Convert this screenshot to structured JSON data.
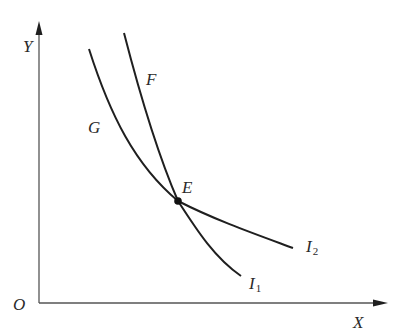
{
  "diagram": {
    "type": "indifference-curves",
    "colors": {
      "background": "#ffffff",
      "line": "#1f1f1f",
      "axis": "#555555",
      "text": "#2a2a2a"
    },
    "axes": {
      "origin_label": "O",
      "x_label": "X",
      "y_label": "Y"
    },
    "curves": [
      {
        "id": "curve-I1",
        "upper_label": "G",
        "end_label": "I",
        "end_subscript": "1",
        "description": "Steeper-at-bottom convex curve passing through E, labeled G above and I1 at lower end"
      },
      {
        "id": "curve-I2",
        "upper_label": "F",
        "end_label": "I",
        "end_subscript": "2",
        "description": "Steep-at-top curve passing through E, flattening after E, labeled F above and I2 at lower end"
      }
    ],
    "intersection": {
      "label": "E",
      "description": "Point where curves I1 and I2 intersect"
    }
  }
}
